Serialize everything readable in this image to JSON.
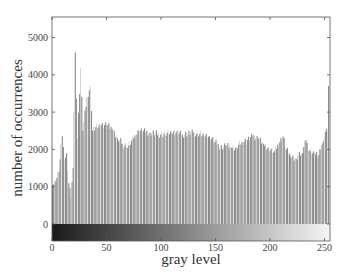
{
  "chart_data": {
    "type": "bar",
    "title": "",
    "xlabel": "gray level",
    "ylabel": "number of occurrences",
    "xlim": [
      0,
      255
    ],
    "ylim": [
      -450,
      5600
    ],
    "xticks": [
      0,
      50,
      100,
      150,
      200,
      250
    ],
    "yticks": [
      0,
      1000,
      2000,
      3000,
      4000,
      5000
    ],
    "grid": false,
    "legend": null,
    "bar_color": "#8c8c8c",
    "colorbar": {
      "position": "below-zero",
      "from": "#1a1a1a",
      "to": "#f5f5f5",
      "description": "gray-level gradient strip"
    },
    "keypoints": [
      {
        "x": 0,
        "y": 1050
      },
      {
        "x": 3,
        "y": 1150
      },
      {
        "x": 6,
        "y": 1400
      },
      {
        "x": 9,
        "y": 2350
      },
      {
        "x": 11,
        "y": 1700
      },
      {
        "x": 13,
        "y": 1900
      },
      {
        "x": 15,
        "y": 1100
      },
      {
        "x": 17,
        "y": 700
      },
      {
        "x": 19,
        "y": 1500
      },
      {
        "x": 21,
        "y": 4600
      },
      {
        "x": 23,
        "y": 2300
      },
      {
        "x": 26,
        "y": 4180
      },
      {
        "x": 28,
        "y": 2500
      },
      {
        "x": 32,
        "y": 3400
      },
      {
        "x": 35,
        "y": 3700
      },
      {
        "x": 37,
        "y": 2500
      },
      {
        "x": 40,
        "y": 2600
      },
      {
        "x": 45,
        "y": 2650
      },
      {
        "x": 50,
        "y": 2650
      },
      {
        "x": 55,
        "y": 2550
      },
      {
        "x": 60,
        "y": 2300
      },
      {
        "x": 65,
        "y": 2150
      },
      {
        "x": 70,
        "y": 2100
      },
      {
        "x": 75,
        "y": 2300
      },
      {
        "x": 80,
        "y": 2500
      },
      {
        "x": 90,
        "y": 2450
      },
      {
        "x": 100,
        "y": 2400
      },
      {
        "x": 110,
        "y": 2450
      },
      {
        "x": 120,
        "y": 2400
      },
      {
        "x": 130,
        "y": 2450
      },
      {
        "x": 140,
        "y": 2400
      },
      {
        "x": 145,
        "y": 2350
      },
      {
        "x": 150,
        "y": 2200
      },
      {
        "x": 155,
        "y": 2050
      },
      {
        "x": 160,
        "y": 2100
      },
      {
        "x": 165,
        "y": 2050
      },
      {
        "x": 170,
        "y": 2050
      },
      {
        "x": 175,
        "y": 2200
      },
      {
        "x": 180,
        "y": 2250
      },
      {
        "x": 185,
        "y": 2350
      },
      {
        "x": 190,
        "y": 2300
      },
      {
        "x": 195,
        "y": 2150
      },
      {
        "x": 200,
        "y": 2050
      },
      {
        "x": 205,
        "y": 1950
      },
      {
        "x": 210,
        "y": 2200
      },
      {
        "x": 213,
        "y": 2350
      },
      {
        "x": 216,
        "y": 2000
      },
      {
        "x": 220,
        "y": 1800
      },
      {
        "x": 225,
        "y": 1750
      },
      {
        "x": 230,
        "y": 1900
      },
      {
        "x": 234,
        "y": 2250
      },
      {
        "x": 238,
        "y": 1950
      },
      {
        "x": 242,
        "y": 1900
      },
      {
        "x": 246,
        "y": 1850
      },
      {
        "x": 250,
        "y": 2200
      },
      {
        "x": 253,
        "y": 2550
      },
      {
        "x": 254,
        "y": 2500
      },
      {
        "x": 255,
        "y": 3700
      }
    ]
  },
  "labels": {
    "xlabel": "gray level",
    "ylabel": "number of occurrences"
  }
}
